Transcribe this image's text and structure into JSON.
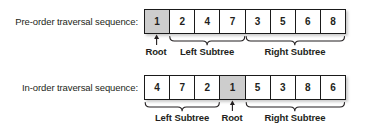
{
  "figure": {
    "type": "diagram",
    "rows": [
      {
        "id": "preorder",
        "caption": "Pre-order traversal sequence:",
        "cells": [
          {
            "value": "1",
            "highlight": true
          },
          {
            "value": "2",
            "highlight": false
          },
          {
            "value": "4",
            "highlight": false
          },
          {
            "value": "7",
            "highlight": false
          },
          {
            "value": "3",
            "highlight": false
          },
          {
            "value": "5",
            "highlight": false
          },
          {
            "value": "6",
            "highlight": false
          },
          {
            "value": "8",
            "highlight": false
          }
        ],
        "annotations": [
          {
            "kind": "arrow",
            "label": "Root",
            "start_index": 0,
            "end_index": 0
          },
          {
            "kind": "brace",
            "label": "Left Subtree",
            "start_index": 1,
            "end_index": 3
          },
          {
            "kind": "brace",
            "label": "Right Subtree",
            "start_index": 4,
            "end_index": 7
          }
        ]
      },
      {
        "id": "inorder",
        "caption": "In-order traversal sequence:",
        "cells": [
          {
            "value": "4",
            "highlight": false
          },
          {
            "value": "7",
            "highlight": false
          },
          {
            "value": "2",
            "highlight": false
          },
          {
            "value": "1",
            "highlight": true
          },
          {
            "value": "5",
            "highlight": false
          },
          {
            "value": "3",
            "highlight": false
          },
          {
            "value": "8",
            "highlight": false
          },
          {
            "value": "6",
            "highlight": false
          }
        ],
        "annotations": [
          {
            "kind": "brace",
            "label": "Left Subtree",
            "start_index": 0,
            "end_index": 2
          },
          {
            "kind": "arrow",
            "label": "Root",
            "start_index": 3,
            "end_index": 3
          },
          {
            "kind": "brace",
            "label": "Right Subtree",
            "start_index": 4,
            "end_index": 7
          }
        ]
      }
    ],
    "colors": {
      "highlight_fill": "#cdcdcd",
      "cell_fill": "#ffffff",
      "border": "#1a1a1a",
      "text": "#231f20",
      "background": "#ffffff"
    },
    "geometry": {
      "table_left": 144,
      "table_width": 202,
      "table_top": 9,
      "table_height": 25,
      "cell_count": 8
    }
  }
}
